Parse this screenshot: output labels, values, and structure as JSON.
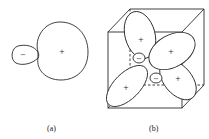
{
  "figure": {
    "panels": [
      {
        "id": "a",
        "caption": "(a)",
        "description": "Single orbital with large positive lobe and small negative lobe",
        "lobes": [
          {
            "sign": "+",
            "size": "large"
          },
          {
            "sign": "−",
            "size": "small"
          }
        ]
      },
      {
        "id": "b",
        "caption": "(b)",
        "description": "Tetrahedral orbitals inscribed in a cube",
        "lobes": [
          {
            "sign": "+",
            "position": "upper-left"
          },
          {
            "sign": "+",
            "position": "upper-right"
          },
          {
            "sign": "+",
            "position": "lower-right"
          },
          {
            "sign": "+",
            "position": "lower-left"
          },
          {
            "sign": "−",
            "position": "center-upper"
          },
          {
            "sign": "−",
            "position": "center-lower"
          }
        ]
      }
    ],
    "colors": {
      "stroke": "#2a2a2a",
      "background": "#ffffff"
    }
  }
}
